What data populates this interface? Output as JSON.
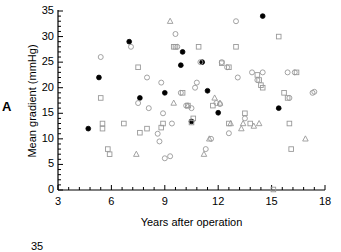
{
  "figure": {
    "panel_label": "A",
    "background_color": "#ffffff",
    "axis_color": "#000000"
  },
  "chart_data": {
    "type": "scatter",
    "title": "",
    "xlabel": "Years after operation",
    "ylabel": "Mean gradient (mmHg)",
    "xlim": [
      3,
      18
    ],
    "ylim": [
      0,
      35
    ],
    "xticks": [
      3,
      6,
      9,
      12,
      15,
      18
    ],
    "yticks": [
      0,
      5,
      10,
      15,
      20,
      25,
      30,
      35
    ],
    "xtick_labels": [
      "3",
      "6",
      "9",
      "12",
      "15",
      "18"
    ],
    "ytick_labels": [
      "0",
      "5",
      "10",
      "15",
      "20",
      "25",
      "30",
      "35"
    ],
    "x_minor_tick_interval": 0.6,
    "y_minor_tick_interval": 1,
    "grid": false,
    "legend": null,
    "marker_types": {
      "filled-circle": "#000000",
      "open-circle": "#999999",
      "open-square": "#999999",
      "open-triangle": "#999999"
    },
    "series": [
      {
        "name": "filled-circle",
        "marker": "filled-circle",
        "points": [
          [
            4.7,
            12.0
          ],
          [
            5.3,
            22.0
          ],
          [
            7.0,
            29.0
          ],
          [
            7.6,
            18.0
          ],
          [
            9.0,
            19.0
          ],
          [
            9.9,
            24.4
          ],
          [
            10.0,
            27.0
          ],
          [
            10.5,
            13.4
          ],
          [
            11.1,
            25.0
          ],
          [
            11.4,
            19.4
          ],
          [
            12.0,
            15.1
          ],
          [
            14.5,
            34.0
          ],
          [
            15.4,
            16.0
          ]
        ]
      },
      {
        "name": "open-circle",
        "marker": "open-circle",
        "points": [
          [
            5.4,
            26.0
          ],
          [
            7.1,
            28.0
          ],
          [
            7.5,
            17.0
          ],
          [
            8.0,
            22.0
          ],
          [
            8.1,
            16.0
          ],
          [
            8.6,
            11.0
          ],
          [
            8.7,
            9.5
          ],
          [
            8.8,
            21.0
          ],
          [
            8.9,
            15.0
          ],
          [
            9.0,
            6.2
          ],
          [
            9.3,
            6.6
          ],
          [
            9.4,
            13.0
          ],
          [
            9.6,
            30.5
          ],
          [
            9.7,
            28.0
          ],
          [
            9.9,
            19.0
          ],
          [
            10.2,
            16.5
          ],
          [
            10.5,
            16.0
          ],
          [
            10.7,
            20.0
          ],
          [
            10.8,
            21.0
          ],
          [
            11.0,
            25.0
          ],
          [
            11.3,
            8.0
          ],
          [
            11.6,
            10.0
          ],
          [
            11.9,
            17.0
          ],
          [
            12.1,
            16.8
          ],
          [
            12.2,
            25.0
          ],
          [
            12.5,
            24.0
          ],
          [
            12.6,
            11.1
          ],
          [
            13.0,
            33.0
          ],
          [
            13.1,
            22.0
          ],
          [
            13.5,
            14.0
          ],
          [
            13.9,
            23.0
          ],
          [
            14.2,
            21.5
          ],
          [
            14.5,
            23.0
          ],
          [
            15.9,
            23.0
          ],
          [
            16.0,
            18.0
          ],
          [
            16.3,
            23.0
          ],
          [
            17.3,
            19.0
          ],
          [
            17.4,
            19.2
          ]
        ]
      },
      {
        "name": "open-square",
        "marker": "open-square",
        "points": [
          [
            5.4,
            18.0
          ],
          [
            5.5,
            13.0
          ],
          [
            5.5,
            12.0
          ],
          [
            5.8,
            8.0
          ],
          [
            5.9,
            7.0
          ],
          [
            6.7,
            13.0
          ],
          [
            7.5,
            24.0
          ],
          [
            7.6,
            11.2
          ],
          [
            8.0,
            12.0
          ],
          [
            8.8,
            12.2
          ],
          [
            8.9,
            13.0
          ],
          [
            9.5,
            28.0
          ],
          [
            9.6,
            28.0
          ],
          [
            10.0,
            19.0
          ],
          [
            10.3,
            16.5
          ],
          [
            10.5,
            13.2
          ],
          [
            10.6,
            14.0
          ],
          [
            10.9,
            28.0
          ],
          [
            11.7,
            16.5
          ],
          [
            12.2,
            24.8
          ],
          [
            12.6,
            24.0
          ],
          [
            12.6,
            13.0
          ],
          [
            13.0,
            28.0
          ],
          [
            13.5,
            15.0
          ],
          [
            13.8,
            13.0
          ],
          [
            14.2,
            22.5
          ],
          [
            14.3,
            21.5
          ],
          [
            14.4,
            20.5
          ],
          [
            14.5,
            20.0
          ],
          [
            15.4,
            30.0
          ],
          [
            15.7,
            19.0
          ],
          [
            15.9,
            18.0
          ],
          [
            16.0,
            13.0
          ],
          [
            16.1,
            8.0
          ],
          [
            16.4,
            23.0
          ],
          [
            15.1,
            0.1
          ]
        ]
      },
      {
        "name": "open-triangle",
        "marker": "open-triangle",
        "points": [
          [
            7.4,
            7.0
          ],
          [
            9.3,
            33.0
          ],
          [
            9.5,
            17.0
          ],
          [
            10.3,
            16.5
          ],
          [
            11.2,
            7.0
          ],
          [
            11.5,
            10.0
          ],
          [
            11.8,
            18.0
          ],
          [
            12.1,
            17.0
          ],
          [
            12.7,
            13.0
          ],
          [
            13.3,
            12.0
          ],
          [
            13.4,
            13.0
          ],
          [
            14.0,
            12.5
          ],
          [
            14.3,
            13.0
          ],
          [
            16.9,
            10.0
          ]
        ]
      }
    ]
  },
  "partial_next_panel": {
    "ytick_label": "35"
  }
}
